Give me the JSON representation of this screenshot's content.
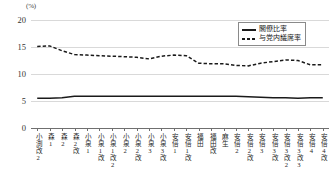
{
  "chart_data": {
    "type": "line",
    "title": "",
    "xlabel": "",
    "ylabel": "(%)",
    "ylim": [
      0,
      20
    ],
    "yticks": [
      0,
      5,
      10,
      15,
      20
    ],
    "grid": true,
    "legend_position": "top-right",
    "categories": [
      "小渕改2",
      "森1",
      "森2",
      "森2改",
      "小泉1",
      "小泉1改",
      "小泉1改2",
      "小泉2",
      "小泉2改",
      "小泉3",
      "小泉3改",
      "安倍1",
      "安倍1改",
      "福田",
      "福田改",
      "麻生",
      "安倍2",
      "安倍2改",
      "安倍3",
      "安倍3改",
      "安倍3改2",
      "安倍3改3",
      "安倍4",
      "安倍4改"
    ],
    "series": [
      {
        "name": "閣僚比率",
        "style": "solid",
        "color": "#1a1a1a",
        "values": [
          5.5,
          5.5,
          5.6,
          5.9,
          5.9,
          5.9,
          5.9,
          5.9,
          5.9,
          5.9,
          5.9,
          5.9,
          5.9,
          5.9,
          5.9,
          5.9,
          5.9,
          5.8,
          5.7,
          5.6,
          5.6,
          5.5,
          5.6,
          5.6
        ]
      },
      {
        "name": "与党内議席率",
        "style": "dashed",
        "color": "#1a1a1a",
        "values": [
          15.1,
          15.2,
          14.3,
          13.6,
          13.5,
          13.4,
          13.3,
          13.2,
          13.1,
          12.8,
          13.3,
          13.5,
          13.4,
          12.0,
          11.9,
          11.9,
          11.6,
          11.5,
          12.0,
          12.3,
          12.6,
          12.5,
          11.7,
          11.7
        ]
      }
    ]
  },
  "axis": {
    "y_unit": "(%)",
    "y_tick_labels": [
      "20",
      "15",
      "10",
      "5",
      "0"
    ]
  },
  "legend": {
    "entries": [
      {
        "label": "閣僚比率",
        "style": "solid"
      },
      {
        "label": "与党内議席率",
        "style": "dashed"
      }
    ]
  }
}
